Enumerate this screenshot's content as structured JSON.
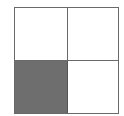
{
  "diagram": {
    "type": "2x2 grid",
    "rows": 2,
    "cols": 2,
    "cells": [
      {
        "row": 0,
        "col": 0,
        "shaded": false,
        "fill": "#ffffff"
      },
      {
        "row": 0,
        "col": 1,
        "shaded": false,
        "fill": "#ffffff"
      },
      {
        "row": 1,
        "col": 0,
        "shaded": true,
        "fill": "#6e6e6e"
      },
      {
        "row": 1,
        "col": 1,
        "shaded": false,
        "fill": "#ffffff"
      }
    ],
    "border_color": "#6a6a6a"
  }
}
